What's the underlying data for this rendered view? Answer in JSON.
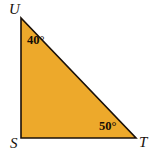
{
  "figure": {
    "type": "geometry-diagram",
    "shape": "right-triangle",
    "background_color": "#ffffff",
    "fill_color": "#eda92b",
    "stroke_color": "#1a1008",
    "stroke_width": 1.6,
    "width": 154,
    "height": 154,
    "points": "21,18 21,138 136,138",
    "vertices": [
      {
        "id": "U",
        "label": "U",
        "x": 21,
        "y": 18,
        "position": "top-left"
      },
      {
        "id": "S",
        "label": "S",
        "x": 21,
        "y": 138,
        "position": "bottom-left"
      },
      {
        "id": "T",
        "label": "T",
        "x": 136,
        "y": 138,
        "position": "bottom-right"
      }
    ],
    "angles": [
      {
        "at_vertex": "U",
        "label": "40°",
        "value": 40,
        "unit": "degrees"
      },
      {
        "at_vertex": "S",
        "label": "",
        "value": 90,
        "unit": "degrees",
        "marked": false
      },
      {
        "at_vertex": "T",
        "label": "50°",
        "value": 50,
        "unit": "degrees"
      }
    ],
    "edges": [
      {
        "from": "U",
        "to": "S",
        "name": "left-leg"
      },
      {
        "from": "S",
        "to": "T",
        "name": "bottom-leg"
      },
      {
        "from": "T",
        "to": "U",
        "name": "hypotenuse"
      }
    ]
  }
}
